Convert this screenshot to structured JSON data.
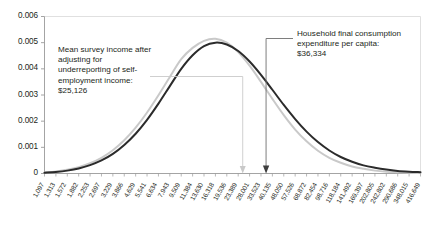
{
  "chart_data": {
    "type": "line",
    "title": "",
    "xlabel": "",
    "ylabel": "",
    "ylim": [
      0,
      0.006
    ],
    "yticks": [
      "0",
      "0.001",
      "0.002",
      "0.003",
      "0.004",
      "0.005",
      "0.006"
    ],
    "ytick_values": [
      0,
      0.001,
      0.002,
      0.003,
      0.004,
      0.005,
      0.006
    ],
    "grid": "horizontal-top-only",
    "legend": "none",
    "xscale": "log",
    "categories": [
      "1,097",
      "1,313",
      "1,572",
      "1,882",
      "2,253",
      "2,697",
      "3,229",
      "3,866",
      "4,629",
      "5,541",
      "6,634",
      "7,943",
      "9,509",
      "11,384",
      "13,630",
      "16,318",
      "19,536",
      "23,389",
      "28,001",
      "33,523",
      "40,135",
      "48,050",
      "57,526",
      "68,872",
      "82,454",
      "98,716",
      "118,184",
      "141,492",
      "169,397",
      "202,805",
      "242,802",
      "290,686",
      "348,015",
      "416,649"
    ],
    "series": [
      {
        "name": "light-gray-distribution",
        "color": "#c9c9c9",
        "values": [
          4e-05,
          8e-05,
          0.00014,
          0.00024,
          0.00039,
          0.0006,
          0.00089,
          0.00127,
          0.00175,
          0.00233,
          0.00299,
          0.00369,
          0.00437,
          0.0048,
          0.00507,
          0.00515,
          0.005,
          0.00464,
          0.00412,
          0.0035,
          0.00285,
          0.00223,
          0.00168,
          0.00123,
          0.00087,
          0.0006,
          0.00041,
          0.00027,
          0.00018,
          0.00011,
          7e-05,
          5e-05,
          3e-05,
          2e-05
        ]
      },
      {
        "name": "dark-distribution",
        "color": "#2b2b2b",
        "values": [
          3e-05,
          6e-05,
          0.00011,
          0.00019,
          0.00032,
          0.0005,
          0.00075,
          0.00109,
          0.00152,
          0.00205,
          0.00267,
          0.00334,
          0.004,
          0.00452,
          0.00487,
          0.005,
          0.00493,
          0.00468,
          0.00428,
          0.00377,
          0.0032,
          0.00262,
          0.00208,
          0.0016,
          0.0012,
          0.00088,
          0.00063,
          0.00045,
          0.00031,
          0.00022,
          0.00015,
          0.0001,
          7e-05,
          5e-05
        ]
      }
    ],
    "annotations": [
      {
        "name": "mean-survey-income",
        "text": "Mean survey income after adjusting for underreporting of self-employment income: $25,126",
        "value": 25126,
        "marker_color": "#c9c9c9"
      },
      {
        "name": "household-final-consumption",
        "text": "Household final consumption expenditure per capita: $36,334",
        "value": 36334,
        "marker_color": "#2b2b2b"
      }
    ]
  },
  "annotations": {
    "left": "Mean survey income after adjusting for underreporting of self-employment income: $25,126",
    "right": "Household final consumption expenditure per capita: $36,334"
  }
}
